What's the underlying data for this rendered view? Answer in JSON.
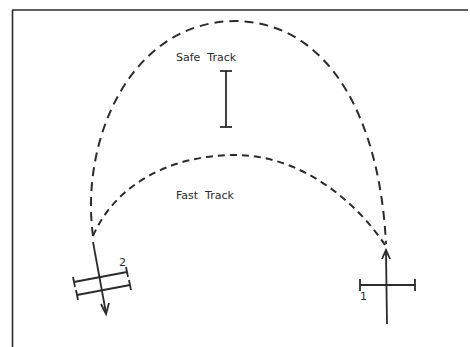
{
  "diagram": {
    "labels": {
      "safe_track": "Safe  Track",
      "fast_track": "Fast  Track",
      "marker_1": "1",
      "marker_2": "2"
    },
    "colors": {
      "ink": "#2b2b2b",
      "background": "#ffffff"
    },
    "elements": [
      {
        "name": "safe-track",
        "type": "dashed-curve",
        "description": "tall outer arc"
      },
      {
        "name": "fast-track",
        "type": "dashed-curve",
        "description": "lower inner arc"
      },
      {
        "name": "vehicle-2",
        "type": "double-bar-cross",
        "direction": "down-left"
      },
      {
        "name": "vehicle-1",
        "type": "single-bar-cross",
        "direction": "up"
      },
      {
        "name": "safe-track-scale",
        "type": "I-bar"
      }
    ]
  }
}
